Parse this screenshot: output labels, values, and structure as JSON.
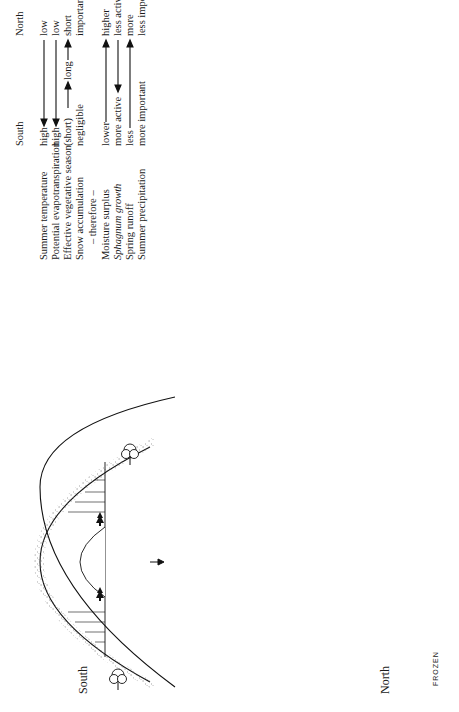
{
  "figure": {
    "orientation": "rotated 90 degrees counter-clockwise",
    "region_labels": {
      "south": "South",
      "north": "North"
    },
    "frozen_label": "FROZEN"
  },
  "table": {
    "header": {
      "south": "South",
      "north": "North"
    },
    "rows": [
      {
        "factor": "Summer temperature",
        "south": "high",
        "north": "low",
        "arrow": "south-to-north-decrease"
      },
      {
        "factor": "Potential evapotranspiration",
        "south": "high",
        "north": "low",
        "arrow": "south-to-north-decrease"
      },
      {
        "factor": "Effective vegetative season",
        "south": "(short)",
        "middle": "long",
        "north": "short",
        "arrow": "short-long-short"
      },
      {
        "factor": "Snow accumulation",
        "south": "negligible",
        "north": "important",
        "arrow": "none"
      },
      {
        "factor": "– therefore –",
        "south": "",
        "north": "",
        "arrow": "none"
      },
      {
        "factor": "Moisture surplus",
        "south": "lower",
        "north": "higher",
        "arrow": "south-to-north-increase"
      },
      {
        "factor": "Sphagnum growth",
        "south": "more active",
        "north": "less active",
        "arrow": "south-to-north-decrease"
      },
      {
        "factor": "Spring runoff",
        "south": "less",
        "north": "more",
        "arrow": "south-to-north-increase"
      },
      {
        "factor": "Summer precipitation",
        "south": "more important",
        "north": "less important",
        "arrow": "none"
      }
    ]
  }
}
